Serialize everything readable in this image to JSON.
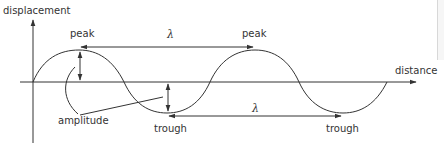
{
  "diagram": {
    "axes": {
      "y_label": "displacement",
      "x_label": "distance"
    },
    "labels": {
      "peak_1": "peak",
      "peak_2": "peak",
      "trough_1": "trough",
      "trough_2": "trough",
      "amplitude": "amplitude",
      "wavelength_top": "λ",
      "wavelength_bottom": "λ"
    },
    "colors": {
      "line": "#333333",
      "text": "#333333",
      "background": "#ffffff"
    }
  }
}
